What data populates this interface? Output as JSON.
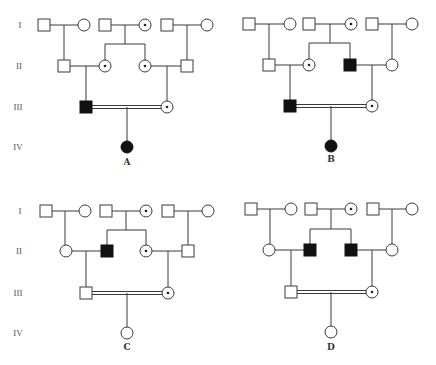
{
  "figure": {
    "type": "pedigree-chart",
    "symbol_size": 12,
    "colors": {
      "line": "#3a3a3a",
      "affected": "#111111",
      "unaffected": "#ffffff",
      "carrier_dot": "#222222"
    }
  },
  "panels": [
    {
      "label": "A",
      "label_pos": [
        127,
        165
      ],
      "generation_labels": [
        {
          "text": "I",
          "x": 20,
          "y": 28
        },
        {
          "text": "II",
          "x": 19,
          "y": 69
        },
        {
          "text": "III",
          "x": 18,
          "y": 110
        },
        {
          "text": "IV",
          "x": 18,
          "y": 150
        }
      ],
      "individuals": [
        {
          "id": "I-1",
          "sex": "male",
          "status": "unaffected",
          "x": 44,
          "y": 25
        },
        {
          "id": "I-2",
          "sex": "female",
          "status": "unaffected",
          "x": 84,
          "y": 25
        },
        {
          "id": "I-3",
          "sex": "male",
          "status": "unaffected",
          "x": 105,
          "y": 25
        },
        {
          "id": "I-4",
          "sex": "female",
          "status": "carrier",
          "x": 145,
          "y": 25
        },
        {
          "id": "I-5",
          "sex": "male",
          "status": "unaffected",
          "x": 167,
          "y": 25
        },
        {
          "id": "I-6",
          "sex": "female",
          "status": "unaffected",
          "x": 207,
          "y": 25
        },
        {
          "id": "II-1",
          "sex": "male",
          "status": "unaffected",
          "x": 64,
          "y": 66
        },
        {
          "id": "II-2",
          "sex": "female",
          "status": "carrier",
          "x": 105,
          "y": 66
        },
        {
          "id": "II-3",
          "sex": "female",
          "status": "carrier",
          "x": 145,
          "y": 66
        },
        {
          "id": "II-4",
          "sex": "male",
          "status": "unaffected",
          "x": 187,
          "y": 66
        },
        {
          "id": "III-1",
          "sex": "male",
          "status": "affected",
          "x": 86,
          "y": 107
        },
        {
          "id": "III-2",
          "sex": "female",
          "status": "carrier",
          "x": 167,
          "y": 107
        },
        {
          "id": "IV-1",
          "sex": "female",
          "status": "affected",
          "x": 127,
          "y": 147
        }
      ],
      "matings": [
        {
          "from": [
            50,
            25
          ],
          "to": [
            78,
            25
          ],
          "consanguineous": false
        },
        {
          "from": [
            111,
            25
          ],
          "to": [
            139,
            25
          ],
          "consanguineous": false
        },
        {
          "from": [
            173,
            25
          ],
          "to": [
            201,
            25
          ],
          "consanguineous": false
        },
        {
          "from": [
            70,
            66
          ],
          "to": [
            99,
            66
          ],
          "consanguineous": false
        },
        {
          "from": [
            151,
            66
          ],
          "to": [
            181,
            66
          ],
          "consanguineous": false
        },
        {
          "from": [
            92,
            107
          ],
          "to": [
            161,
            107
          ],
          "consanguineous": true
        }
      ],
      "descent_lines": [
        [
          [
            64,
            25
          ],
          [
            64,
            60
          ]
        ],
        [
          [
            125,
            25
          ],
          [
            125,
            44
          ],
          [
            105,
            44
          ],
          [
            105,
            60
          ]
        ],
        [
          [
            125,
            44
          ],
          [
            145,
            44
          ],
          [
            145,
            60
          ]
        ],
        [
          [
            187,
            25
          ],
          [
            187,
            60
          ]
        ],
        [
          [
            86,
            66
          ],
          [
            86,
            101
          ]
        ],
        [
          [
            167,
            66
          ],
          [
            167,
            101
          ]
        ],
        [
          [
            127,
            107
          ],
          [
            127,
            141
          ]
        ]
      ]
    },
    {
      "label": "B",
      "label_pos": [
        331,
        162
      ],
      "generation_labels": [],
      "individuals": [
        {
          "id": "I-1",
          "sex": "male",
          "status": "unaffected",
          "x": 249,
          "y": 24
        },
        {
          "id": "I-2",
          "sex": "female",
          "status": "unaffected",
          "x": 290,
          "y": 24
        },
        {
          "id": "I-3",
          "sex": "male",
          "status": "unaffected",
          "x": 309,
          "y": 24
        },
        {
          "id": "I-4",
          "sex": "female",
          "status": "carrier",
          "x": 351,
          "y": 24
        },
        {
          "id": "I-5",
          "sex": "male",
          "status": "unaffected",
          "x": 372,
          "y": 24
        },
        {
          "id": "I-6",
          "sex": "female",
          "status": "unaffected",
          "x": 412,
          "y": 24
        },
        {
          "id": "II-1",
          "sex": "male",
          "status": "unaffected",
          "x": 269,
          "y": 65
        },
        {
          "id": "II-2",
          "sex": "female",
          "status": "carrier",
          "x": 309,
          "y": 65
        },
        {
          "id": "II-3",
          "sex": "male",
          "status": "affected",
          "x": 350,
          "y": 65
        },
        {
          "id": "II-4",
          "sex": "female",
          "status": "unaffected",
          "x": 392,
          "y": 65
        },
        {
          "id": "III-1",
          "sex": "male",
          "status": "affected",
          "x": 290,
          "y": 106
        },
        {
          "id": "III-2",
          "sex": "female",
          "status": "carrier",
          "x": 372,
          "y": 106
        },
        {
          "id": "IV-1",
          "sex": "female",
          "status": "affected",
          "x": 331,
          "y": 146
        }
      ],
      "matings": [
        {
          "from": [
            255,
            24
          ],
          "to": [
            284,
            24
          ],
          "consanguineous": false
        },
        {
          "from": [
            315,
            24
          ],
          "to": [
            345,
            24
          ],
          "consanguineous": false
        },
        {
          "from": [
            378,
            24
          ],
          "to": [
            406,
            24
          ],
          "consanguineous": false
        },
        {
          "from": [
            275,
            65
          ],
          "to": [
            303,
            65
          ],
          "consanguineous": false
        },
        {
          "from": [
            356,
            65
          ],
          "to": [
            386,
            65
          ],
          "consanguineous": false
        },
        {
          "from": [
            296,
            106
          ],
          "to": [
            366,
            106
          ],
          "consanguineous": true
        }
      ],
      "descent_lines": [
        [
          [
            269,
            24
          ],
          [
            269,
            59
          ]
        ],
        [
          [
            330,
            24
          ],
          [
            330,
            43
          ],
          [
            309,
            43
          ],
          [
            309,
            59
          ]
        ],
        [
          [
            330,
            43
          ],
          [
            350,
            43
          ],
          [
            350,
            59
          ]
        ],
        [
          [
            392,
            24
          ],
          [
            392,
            59
          ]
        ],
        [
          [
            290,
            65
          ],
          [
            290,
            100
          ]
        ],
        [
          [
            372,
            65
          ],
          [
            372,
            100
          ]
        ],
        [
          [
            331,
            106
          ],
          [
            331,
            140
          ]
        ]
      ]
    },
    {
      "label": "C",
      "label_pos": [
        127,
        350
      ],
      "generation_labels": [
        {
          "text": "I",
          "x": 20,
          "y": 214
        },
        {
          "text": "II",
          "x": 19,
          "y": 254
        },
        {
          "text": "III",
          "x": 18,
          "y": 296
        },
        {
          "text": "IV",
          "x": 18,
          "y": 336
        }
      ],
      "individuals": [
        {
          "id": "I-1",
          "sex": "male",
          "status": "unaffected",
          "x": 46,
          "y": 211
        },
        {
          "id": "I-2",
          "sex": "female",
          "status": "unaffected",
          "x": 85,
          "y": 211
        },
        {
          "id": "I-3",
          "sex": "male",
          "status": "unaffected",
          "x": 106,
          "y": 211
        },
        {
          "id": "I-4",
          "sex": "female",
          "status": "carrier",
          "x": 146,
          "y": 211
        },
        {
          "id": "I-5",
          "sex": "male",
          "status": "unaffected",
          "x": 168,
          "y": 211
        },
        {
          "id": "I-6",
          "sex": "female",
          "status": "unaffected",
          "x": 208,
          "y": 211
        },
        {
          "id": "II-1",
          "sex": "female",
          "status": "unaffected",
          "x": 66,
          "y": 251
        },
        {
          "id": "II-2",
          "sex": "male",
          "status": "affected",
          "x": 107,
          "y": 251
        },
        {
          "id": "II-3",
          "sex": "female",
          "status": "carrier",
          "x": 146,
          "y": 251
        },
        {
          "id": "II-4",
          "sex": "male",
          "status": "unaffected",
          "x": 188,
          "y": 251
        },
        {
          "id": "III-1",
          "sex": "male",
          "status": "unaffected",
          "x": 86,
          "y": 293
        },
        {
          "id": "III-2",
          "sex": "female",
          "status": "carrier",
          "x": 168,
          "y": 293
        },
        {
          "id": "IV-1",
          "sex": "female",
          "status": "unaffected",
          "x": 127,
          "y": 333
        }
      ],
      "matings": [
        {
          "from": [
            52,
            211
          ],
          "to": [
            79,
            211
          ],
          "consanguineous": false
        },
        {
          "from": [
            112,
            211
          ],
          "to": [
            140,
            211
          ],
          "consanguineous": false
        },
        {
          "from": [
            174,
            211
          ],
          "to": [
            202,
            211
          ],
          "consanguineous": false
        },
        {
          "from": [
            72,
            251
          ],
          "to": [
            101,
            251
          ],
          "consanguineous": false
        },
        {
          "from": [
            152,
            251
          ],
          "to": [
            182,
            251
          ],
          "consanguineous": false
        },
        {
          "from": [
            92,
            293
          ],
          "to": [
            162,
            293
          ],
          "consanguineous": true
        }
      ],
      "descent_lines": [
        [
          [
            65,
            211
          ],
          [
            65,
            245
          ]
        ],
        [
          [
            126,
            211
          ],
          [
            126,
            230
          ],
          [
            107,
            230
          ],
          [
            107,
            245
          ]
        ],
        [
          [
            126,
            230
          ],
          [
            146,
            230
          ],
          [
            146,
            245
          ]
        ],
        [
          [
            188,
            211
          ],
          [
            188,
            245
          ]
        ],
        [
          [
            86,
            251
          ],
          [
            86,
            287
          ]
        ],
        [
          [
            168,
            251
          ],
          [
            168,
            287
          ]
        ],
        [
          [
            127,
            293
          ],
          [
            127,
            327
          ]
        ]
      ]
    },
    {
      "label": "D",
      "label_pos": [
        331,
        350
      ],
      "generation_labels": [],
      "individuals": [
        {
          "id": "I-1",
          "sex": "male",
          "status": "unaffected",
          "x": 251,
          "y": 209
        },
        {
          "id": "I-2",
          "sex": "female",
          "status": "unaffected",
          "x": 291,
          "y": 209
        },
        {
          "id": "I-3",
          "sex": "male",
          "status": "unaffected",
          "x": 311,
          "y": 209
        },
        {
          "id": "I-4",
          "sex": "female",
          "status": "carrier",
          "x": 351,
          "y": 209
        },
        {
          "id": "I-5",
          "sex": "male",
          "status": "unaffected",
          "x": 373,
          "y": 209
        },
        {
          "id": "I-6",
          "sex": "female",
          "status": "unaffected",
          "x": 412,
          "y": 209
        },
        {
          "id": "II-1",
          "sex": "female",
          "status": "unaffected",
          "x": 269,
          "y": 250
        },
        {
          "id": "II-2",
          "sex": "male",
          "status": "affected",
          "x": 310,
          "y": 250
        },
        {
          "id": "II-3",
          "sex": "male",
          "status": "affected",
          "x": 351,
          "y": 250
        },
        {
          "id": "II-4",
          "sex": "female",
          "status": "unaffected",
          "x": 392,
          "y": 250
        },
        {
          "id": "III-1",
          "sex": "male",
          "status": "unaffected",
          "x": 291,
          "y": 292
        },
        {
          "id": "III-2",
          "sex": "female",
          "status": "carrier",
          "x": 372,
          "y": 292
        },
        {
          "id": "IV-1",
          "sex": "female",
          "status": "unaffected",
          "x": 331,
          "y": 332
        }
      ],
      "matings": [
        {
          "from": [
            257,
            209
          ],
          "to": [
            285,
            209
          ],
          "consanguineous": false
        },
        {
          "from": [
            317,
            209
          ],
          "to": [
            345,
            209
          ],
          "consanguineous": false
        },
        {
          "from": [
            379,
            209
          ],
          "to": [
            406,
            209
          ],
          "consanguineous": false
        },
        {
          "from": [
            275,
            250
          ],
          "to": [
            304,
            250
          ],
          "consanguineous": false
        },
        {
          "from": [
            357,
            250
          ],
          "to": [
            386,
            250
          ],
          "consanguineous": false
        },
        {
          "from": [
            297,
            292
          ],
          "to": [
            366,
            292
          ],
          "consanguineous": true
        }
      ],
      "descent_lines": [
        [
          [
            270,
            209
          ],
          [
            270,
            244
          ]
        ],
        [
          [
            331,
            209
          ],
          [
            331,
            229
          ],
          [
            310,
            229
          ],
          [
            310,
            244
          ]
        ],
        [
          [
            331,
            229
          ],
          [
            351,
            229
          ],
          [
            351,
            244
          ]
        ],
        [
          [
            392,
            209
          ],
          [
            392,
            244
          ]
        ],
        [
          [
            291,
            250
          ],
          [
            291,
            286
          ]
        ],
        [
          [
            372,
            250
          ],
          [
            372,
            286
          ]
        ],
        [
          [
            331,
            292
          ],
          [
            331,
            326
          ]
        ]
      ]
    }
  ]
}
